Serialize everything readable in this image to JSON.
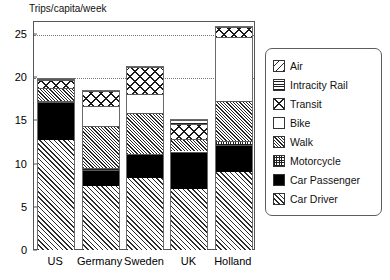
{
  "chart_data": {
    "type": "bar",
    "stacked": true,
    "title": "Trips/capita/week",
    "xlabel": "",
    "ylabel": "Trips/capita/week",
    "ylim": [
      0,
      26.5
    ],
    "yticks": [
      0,
      5,
      10,
      15,
      20,
      25
    ],
    "gridlines": [
      20,
      25
    ],
    "grid": true,
    "legend_position": "right",
    "categories": [
      "US",
      "Germany",
      "Sweden",
      "UK",
      "Holland"
    ],
    "series": [
      {
        "name": "Car Driver",
        "pattern": "diagonal-hatch",
        "values": [
          12.7,
          7.4,
          8.3,
          7.1,
          9.0
        ]
      },
      {
        "name": "Car Passenger",
        "pattern": "solid-black",
        "values": [
          4.4,
          1.9,
          2.8,
          4.3,
          3.2
        ]
      },
      {
        "name": "Motorcycle",
        "pattern": "grid",
        "values": [
          0.1,
          0.2,
          0.0,
          0.0,
          0.4
        ]
      },
      {
        "name": "Walk",
        "pattern": "fine-diagonal-hatch",
        "values": [
          1.6,
          4.9,
          4.7,
          1.5,
          4.6
        ]
      },
      {
        "name": "Bike",
        "pattern": "white",
        "values": [
          0.0,
          2.3,
          2.2,
          0.0,
          7.4
        ]
      },
      {
        "name": "Transit",
        "pattern": "crosshatch-diamond",
        "values": [
          0.9,
          1.7,
          3.2,
          1.7,
          1.2
        ]
      },
      {
        "name": "Intracity Rail",
        "pattern": "horizontal-lines",
        "values": [
          0.1,
          0.0,
          0.0,
          0.4,
          0.0
        ]
      },
      {
        "name": "Air",
        "pattern": "wide-diagonal",
        "values": [
          0.0,
          0.0,
          0.0,
          0.0,
          0.0
        ]
      }
    ],
    "totals": [
      19.8,
      18.4,
      21.2,
      15.0,
      25.8
    ]
  },
  "axis": {
    "y_tick_labels": [
      "0",
      "5",
      "10",
      "15",
      "20",
      "25"
    ],
    "x_tick_labels": [
      "US",
      "Germany",
      "Sweden",
      "UK",
      "Holland"
    ]
  },
  "legend": {
    "items": [
      {
        "label": "Air"
      },
      {
        "label": "Intracity Rail"
      },
      {
        "label": "Transit"
      },
      {
        "label": "Bike"
      },
      {
        "label": "Walk"
      },
      {
        "label": "Motorcycle"
      },
      {
        "label": "Car Passenger"
      },
      {
        "label": "Car Driver"
      }
    ]
  },
  "colors": {
    "ink": "#000000",
    "frame": "#555555",
    "grid": "#777777",
    "background": "#ffffff"
  }
}
